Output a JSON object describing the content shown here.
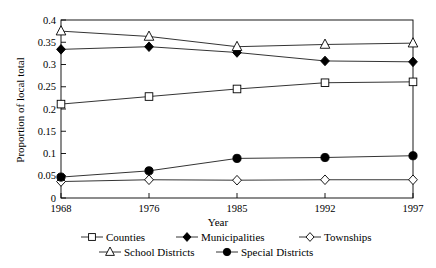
{
  "chart_data": {
    "type": "line",
    "title": "",
    "xlabel": "Year",
    "ylabel": "Proportion of local total",
    "x": [
      1968,
      1976,
      1985,
      1992,
      1997
    ],
    "xtick_labels": [
      "1968",
      "1976",
      "1985",
      "1992",
      "1997"
    ],
    "ytick_labels": [
      "0",
      "0.05",
      "0.1",
      "0.15",
      "0.2",
      "0.25",
      "0.3",
      "0.35",
      "0.4"
    ],
    "ytick_values": [
      0,
      0.05,
      0.1,
      0.15,
      0.2,
      0.25,
      0.3,
      0.35,
      0.4
    ],
    "ylim": [
      0,
      0.4
    ],
    "grid": false,
    "legend_position": "below",
    "series": [
      {
        "name": "Counties",
        "marker": "open-square",
        "values": [
          0.211,
          0.228,
          0.245,
          0.259,
          0.261
        ]
      },
      {
        "name": "Municipalities",
        "marker": "filled-diamond",
        "values": [
          0.334,
          0.34,
          0.327,
          0.308,
          0.306
        ]
      },
      {
        "name": "Townships",
        "marker": "open-diamond",
        "values": [
          0.037,
          0.041,
          0.04,
          0.041,
          0.041
        ]
      },
      {
        "name": "School Districts",
        "marker": "open-triangle",
        "values": [
          0.375,
          0.363,
          0.34,
          0.345,
          0.348
        ]
      },
      {
        "name": "Special Districts",
        "marker": "filled-circle",
        "values": [
          0.047,
          0.061,
          0.089,
          0.091,
          0.095
        ]
      }
    ]
  },
  "legend": {
    "rows": [
      [
        "Counties",
        "Municipalities",
        "Townships"
      ],
      [
        "School Districts",
        "Special Districts"
      ]
    ]
  }
}
